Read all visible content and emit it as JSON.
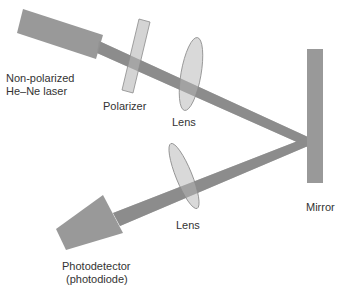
{
  "diagram": {
    "labels": {
      "laser_line1": "Non-polarized",
      "laser_line2": "He–Ne laser",
      "polarizer": "Polarizer",
      "lens_top": "Lens",
      "lens_bottom": "Lens",
      "mirror": "Mirror",
      "detector_line1": "Photodetector",
      "detector_line2": "(photodiode)"
    },
    "colors": {
      "body_fill": "#999999",
      "beam": "#8c8c8c",
      "optic_fill": "#cccccc",
      "optic_stroke": "#8a8a8a",
      "text": "#333333"
    }
  }
}
